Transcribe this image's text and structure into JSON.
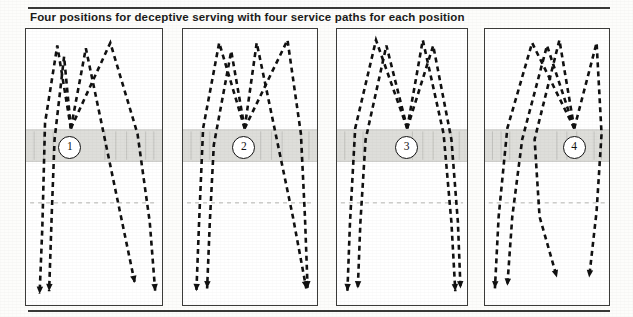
{
  "figure": {
    "title": "Four positions for deceptive serving with four service paths for each position",
    "panel_count": 4
  },
  "colors": {
    "ink": "#111111",
    "court_line": "#3c3c3a",
    "net_band_fill": "#dededa",
    "net_band_line": "#a8a8a4",
    "service_line": "#b4b4b0",
    "paper": "#fdfdfb",
    "rule": "#3a3a38"
  },
  "panels": [
    {
      "id": "panel-1",
      "marker_label": "1",
      "marker_x_pct": 31,
      "x": 25,
      "y": 28,
      "width": 138,
      "height": 278,
      "net_band_top_pct": 36.5,
      "net_band_height_pct": 11.5,
      "service_line_pct": 63,
      "server_x_pct": 33,
      "paths": [
        {
          "name": "path-a",
          "points": "33,36 23,6 14,34 12,72 10,96",
          "arrow": "10,96"
        },
        {
          "name": "path-b",
          "points": "33,36 28,10 21,40 19,66 17,95",
          "arrow": "17,95"
        },
        {
          "name": "path-c",
          "points": "33,36 44,7 58,40 69,66 80,92",
          "arrow": "80,92"
        },
        {
          "name": "path-d",
          "points": "33,36 62,5 82,38 91,70 95,95",
          "arrow": "95,95"
        }
      ]
    },
    {
      "id": "panel-2",
      "marker_label": "2",
      "marker_x_pct": 44,
      "x": 182,
      "y": 28,
      "width": 136,
      "height": 278,
      "net_band_top_pct": 36.5,
      "net_band_height_pct": 11.5,
      "service_line_pct": 63,
      "server_x_pct": 46,
      "paths": [
        {
          "name": "path-a",
          "points": "46,36 27,5 15,36 12,70 10,95",
          "arrow": "10,95"
        },
        {
          "name": "path-b",
          "points": "46,36 36,8 23,42 20,70 18,94",
          "arrow": "18,94"
        },
        {
          "name": "path-c",
          "points": "46,36 55,5 70,40 82,68 92,94",
          "arrow": "92,94"
        },
        {
          "name": "path-d",
          "points": "46,36 78,4 88,38 91,68 93,94",
          "arrow": "93,94"
        }
      ]
    },
    {
      "id": "panel-3",
      "marker_label": "3",
      "marker_x_pct": 52,
      "x": 336,
      "y": 28,
      "width": 132,
      "height": 278,
      "net_band_top_pct": 36.5,
      "net_band_height_pct": 11.5,
      "service_line_pct": 63,
      "server_x_pct": 54,
      "paths": [
        {
          "name": "path-a",
          "points": "54,36 30,4 14,36 10,70 8,95",
          "arrow": "8,95"
        },
        {
          "name": "path-b",
          "points": "54,36 38,6 22,40 18,70 16,94",
          "arrow": "16,94"
        },
        {
          "name": "path-c",
          "points": "54,36 66,4 82,38 88,70 91,95",
          "arrow": "91,95"
        },
        {
          "name": "path-d",
          "points": "54,36 74,6 88,40 93,70 95,94",
          "arrow": "95,94"
        }
      ]
    },
    {
      "id": "panel-4",
      "marker_label": "4",
      "marker_x_pct": 70,
      "x": 484,
      "y": 28,
      "width": 126,
      "height": 278,
      "net_band_top_pct": 36.5,
      "net_band_height_pct": 11.5,
      "service_line_pct": 63,
      "server_x_pct": 72,
      "paths": [
        {
          "name": "path-a",
          "points": "72,36 38,5 18,36 11,68 8,94",
          "arrow": "8,94"
        },
        {
          "name": "path-b",
          "points": "72,36 50,6 30,40 22,68 18,93",
          "arrow": "18,93"
        },
        {
          "name": "path-c",
          "points": "72,36 60,4 40,40 44,68 58,90",
          "arrow": "58,90"
        },
        {
          "name": "path-d",
          "points": "72,36 90,5 94,38 90,66 84,90",
          "arrow": "84,90"
        }
      ]
    }
  ]
}
